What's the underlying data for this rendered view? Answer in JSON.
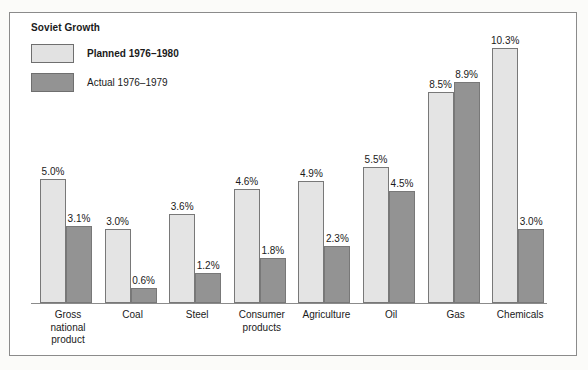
{
  "chart_data": {
    "type": "bar",
    "title": "Soviet Growth",
    "xlabel": "",
    "ylabel": "",
    "ylim": [
      0,
      10.3
    ],
    "grid": false,
    "legend_position": "top-left",
    "value_suffix": "%",
    "categories": [
      "Gross national product",
      "Coal",
      "Steel",
      "Consumer products",
      "Agriculture",
      "Oil",
      "Gas",
      "Chemicals"
    ],
    "series": [
      {
        "name": "Planned 1976–1980",
        "color": "#e4e4e4",
        "values": [
          5.0,
          3.0,
          3.6,
          4.6,
          4.9,
          5.5,
          8.5,
          10.3
        ],
        "labels": [
          "5.0%",
          "3.0%",
          "3.6%",
          "4.6%",
          "4.9%",
          "5.5%",
          "8.5%",
          "10.3%"
        ]
      },
      {
        "name": "Actual 1976–1979",
        "color": "#939393",
        "values": [
          3.1,
          0.6,
          1.2,
          1.8,
          2.3,
          4.5,
          8.9,
          3.0
        ],
        "labels": [
          "3.1%",
          "0.6%",
          "1.2%",
          "1.8%",
          "2.3%",
          "4.5%",
          "8.9%",
          "3.0%"
        ]
      }
    ]
  },
  "category_lines": [
    [
      "Gross",
      "national",
      "product"
    ],
    [
      "Coal"
    ],
    [
      "Steel"
    ],
    [
      "Consumer",
      "products"
    ],
    [
      "Agriculture"
    ],
    [
      "Oil"
    ],
    [
      "Gas"
    ],
    [
      "Chemicals"
    ]
  ]
}
